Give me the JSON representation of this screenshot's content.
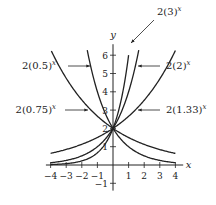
{
  "chart_data": {
    "type": "line",
    "title": "",
    "xlabel": "x",
    "ylabel": "y",
    "xlim": [
      -4,
      4
    ],
    "ylim": [
      -1,
      6.5
    ],
    "grid": false,
    "x_ticks": [
      "-4",
      "-3",
      "-2",
      "-1",
      "1",
      "2",
      "3",
      "4"
    ],
    "y_ticks": [
      "-1",
      "1",
      "2",
      "3",
      "4",
      "5",
      "6"
    ],
    "series": [
      {
        "name": "2(3)^x",
        "base": 3,
        "coef": 2
      },
      {
        "name": "2(2)^x",
        "base": 2,
        "coef": 2
      },
      {
        "name": "2(1.33)^x",
        "base": 1.33,
        "coef": 2
      },
      {
        "name": "2(0.5)^x",
        "base": 0.5,
        "coef": 2
      },
      {
        "name": "2(0.75)^x",
        "base": 0.75,
        "coef": 2
      }
    ],
    "annotations": [
      {
        "text": "2(3)^x",
        "points_to": "2(3)^x"
      },
      {
        "text": "2(2)^x",
        "points_to": "2(2)^x"
      },
      {
        "text": "2(1.33)^x",
        "points_to": "2(1.33)^x"
      },
      {
        "text": "2(0.5)^x",
        "points_to": "2(0.5)^x"
      },
      {
        "text": "2(0.75)^x",
        "points_to": "2(0.75)^x"
      }
    ]
  },
  "labels": {
    "y_axis": "y",
    "x_axis": "x",
    "base3": "2(3)",
    "base2": "2(2)",
    "base133": "2(1.33)",
    "base05": "2(0.5)",
    "base075": "2(0.75)",
    "exp": "x"
  }
}
